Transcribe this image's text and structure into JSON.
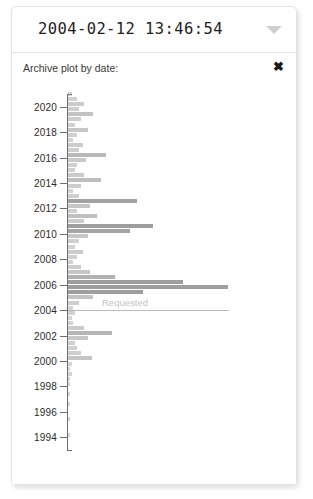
{
  "date_field": {
    "value": "2004-02-12 13:46:54",
    "placeholder": "YYYY-MM-DD HH:MM:SS",
    "caret_icon": "chevron-down-icon"
  },
  "plot_panel": {
    "title": "Archive plot by date:",
    "close_icon": "✖",
    "close_label": "Close"
  },
  "colors": {
    "bar": "#8d8d8d",
    "axis": "#6f6f6f",
    "reference_line": "#b9b9b9",
    "reference_label": "#c2c2c2",
    "text": "#2b2b2b",
    "card_border": "#e3e3e3",
    "caret": "#cfcfcf"
  },
  "chart_data": {
    "type": "bar",
    "orientation": "horizontal",
    "title": "Archive plot by date:",
    "xlabel": "",
    "ylabel": "",
    "grid": false,
    "legend": null,
    "ylim": [
      1993,
      2021
    ],
    "xlim": [
      0,
      100
    ],
    "tick_labels": [
      "2020",
      "2018",
      "2016",
      "2014",
      "2012",
      "2010",
      "2008",
      "2006",
      "2004",
      "2002",
      "2000",
      "1998",
      "1996",
      "1994"
    ],
    "ticks": [
      2020,
      2018,
      2016,
      2014,
      2012,
      2010,
      2008,
      2006,
      2004,
      2002,
      2000,
      1998,
      1996,
      1994
    ],
    "annotations": [
      {
        "label": "Requested",
        "year": 2004,
        "type": "horizontal-line"
      }
    ],
    "categories": [
      2021.0,
      2020.6,
      2020.2,
      2019.8,
      2019.4,
      2019.0,
      2018.6,
      2018.2,
      2017.8,
      2017.4,
      2017.0,
      2016.6,
      2016.2,
      2015.8,
      2015.4,
      2015.0,
      2014.6,
      2014.2,
      2013.8,
      2013.4,
      2013.0,
      2012.6,
      2012.2,
      2011.8,
      2011.4,
      2011.0,
      2010.6,
      2010.2,
      2009.8,
      2009.4,
      2009.0,
      2008.6,
      2008.2,
      2007.8,
      2007.4,
      2007.0,
      2006.6,
      2006.2,
      2005.8,
      2005.4,
      2005.0,
      2004.6,
      2004.2,
      2003.8,
      2003.4,
      2003.0,
      2002.6,
      2002.2,
      2001.8,
      2001.4,
      2001.0,
      2000.6,
      2000.2,
      1999.8,
      1999.4,
      1999.0,
      1998.6,
      1998.2,
      1997.8,
      1997.4,
      1997.0,
      1996.6,
      1996.2,
      1995.8,
      1995.4,
      1995.0,
      1994.6,
      1994.2,
      1993.8
    ],
    "values": [
      2,
      5,
      9,
      6,
      14,
      7,
      4,
      11,
      5,
      3,
      8,
      6,
      21,
      10,
      5,
      4,
      9,
      18,
      7,
      3,
      6,
      38,
      12,
      5,
      16,
      9,
      47,
      34,
      11,
      6,
      4,
      8,
      5,
      3,
      7,
      12,
      26,
      63,
      88,
      41,
      14,
      6,
      3,
      4,
      2,
      3,
      9,
      24,
      11,
      4,
      5,
      7,
      13,
      2,
      1,
      2,
      1,
      1,
      0,
      1,
      0,
      1,
      0,
      0,
      1,
      0,
      0,
      1,
      0
    ]
  }
}
